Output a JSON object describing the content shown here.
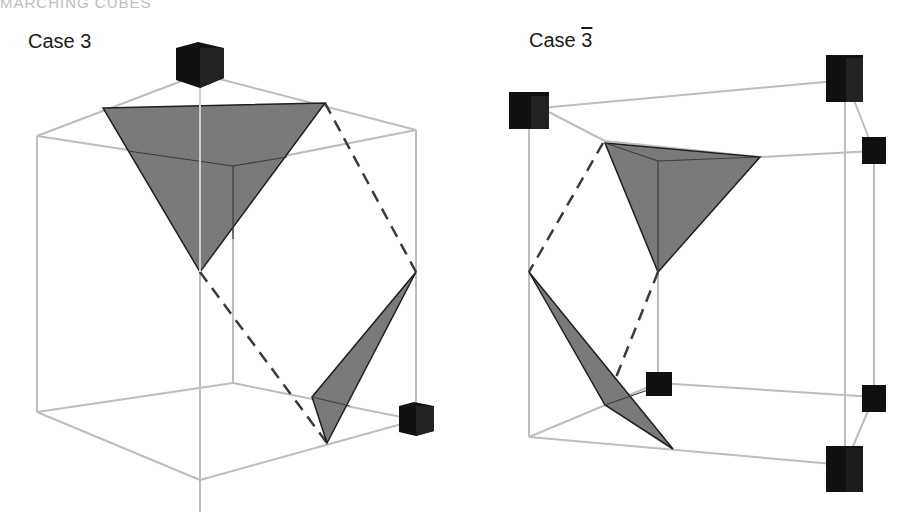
{
  "header": {
    "title": "MARCHING CUBES"
  },
  "figures": [
    {
      "label_prefix": "Case ",
      "label_number": "3",
      "overline": false
    },
    {
      "label_prefix": "Case ",
      "label_number": "3",
      "overline": true
    }
  ],
  "colors": {
    "cube_edge": "#bdbdbd",
    "surface_fill": "#7a7a7a",
    "surface_stroke": "#1f1f1f",
    "vertex_marker": "#111111",
    "dashed_line": "#3a3a3a"
  }
}
